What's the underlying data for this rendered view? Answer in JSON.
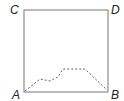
{
  "diagram": {
    "type": "square-with-path",
    "labels": {
      "top_left": "C",
      "top_right": "D",
      "bottom_left": "A",
      "bottom_right": "B"
    },
    "square": {
      "x": 24,
      "y": 10,
      "width": 84,
      "height": 82,
      "stroke": "#777777"
    },
    "path": {
      "style": "dashed",
      "stroke": "#666666",
      "from": "A",
      "to": "B",
      "points": [
        [
          25,
          91
        ],
        [
          40,
          79
        ],
        [
          50,
          81
        ],
        [
          58,
          77
        ],
        [
          63,
          69
        ],
        [
          85,
          69
        ],
        [
          107,
          90
        ]
      ]
    }
  }
}
